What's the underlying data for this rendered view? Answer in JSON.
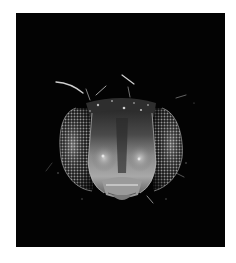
{
  "image": {
    "subject": "fly head (frontal view, grayscale micrograph)",
    "background_color": "#ffffff",
    "panel_color": "#030303",
    "tones": {
      "eye_highlight": "#d8d8d8",
      "eye_mid": "#8a8a8a",
      "face_light": "#bdbdbd",
      "face_mid": "#6f6f6f",
      "face_dark": "#2a2a2a",
      "bristle": "#cfcfcf"
    },
    "parts": [
      "left-compound-eye",
      "right-compound-eye",
      "face",
      "mouthparts",
      "bristles"
    ]
  }
}
